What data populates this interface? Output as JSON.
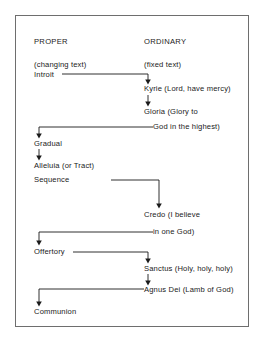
{
  "diagram": {
    "border_color": "#6e6e6e",
    "text_color": "#1a1a1a",
    "arrow_color": "#1a1a1a",
    "columns": [
      {
        "id": "proper",
        "heading": "PROPER",
        "subheading": "(changing text)"
      },
      {
        "id": "ordinary",
        "heading": "ORDINARY",
        "subheading": "(fixed text)"
      }
    ],
    "nodes": [
      {
        "id": "introit",
        "column": "proper",
        "label": "Introit"
      },
      {
        "id": "kyrie",
        "column": "ordinary",
        "label": "Kyrie (Lord, have mercy)"
      },
      {
        "id": "gloria",
        "column": "ordinary",
        "label": "Gloria (Glory to"
      },
      {
        "id": "gloria2",
        "column": "ordinary",
        "label": "God in the highest)"
      },
      {
        "id": "gradual",
        "column": "proper",
        "label": "Gradual"
      },
      {
        "id": "alleluia",
        "column": "proper",
        "label": "Alleluia (or Tract)"
      },
      {
        "id": "sequence",
        "column": "proper",
        "label": "Sequence"
      },
      {
        "id": "credo",
        "column": "ordinary",
        "label": "Credo (I believe"
      },
      {
        "id": "credo2",
        "column": "ordinary",
        "label": "in one God)"
      },
      {
        "id": "offertory",
        "column": "proper",
        "label": "Offertory"
      },
      {
        "id": "sanctus",
        "column": "ordinary",
        "label": "Sanctus (Holy, holy, holy)"
      },
      {
        "id": "agnusdei",
        "column": "ordinary",
        "label": "Agnus Dei (Lamb of God)"
      },
      {
        "id": "communion",
        "column": "proper",
        "label": "Communion"
      }
    ],
    "flow_order": [
      "Introit",
      "Kyrie",
      "Gloria",
      "Gradual",
      "Alleluia (or Tract) / Sequence",
      "Credo",
      "Offertory",
      "Sanctus",
      "Agnus Dei",
      "Communion"
    ]
  }
}
